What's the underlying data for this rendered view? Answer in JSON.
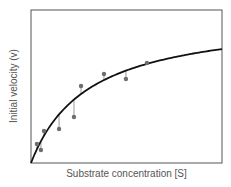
{
  "chart_data": {
    "type": "scatter",
    "title": "",
    "xlabel": "Substrate concentration [S]",
    "ylabel": "Initial velocity (v)",
    "xlim": [
      0,
      10
    ],
    "ylim": [
      0,
      10
    ],
    "grid": false,
    "legend": null,
    "ticks": "none",
    "series": [
      {
        "name": "measured",
        "type": "scatter",
        "x": [
          0.31,
          0.52,
          0.68,
          1.47,
          2.25,
          2.62,
          3.82,
          4.97,
          6.07
        ],
        "y": [
          1.24,
          0.85,
          2.09,
          2.22,
          3.01,
          5.03,
          5.82,
          5.49,
          6.54
        ],
        "residual_lines": true
      },
      {
        "name": "fit",
        "type": "line",
        "model": "michaelis-menten",
        "Vmax": 9.69,
        "Km": 3.01
      }
    ]
  },
  "colors": {
    "curve": "#111111",
    "points": "#6e6e6e",
    "residual": "#9a9a9a",
    "frame": "#555555",
    "text": "#555555"
  }
}
